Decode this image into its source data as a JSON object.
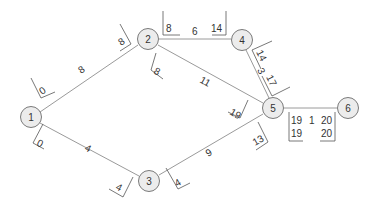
{
  "diagram": {
    "type": "activity-network",
    "nodes": [
      {
        "id": "1",
        "label": "1",
        "x": 31,
        "y": 117
      },
      {
        "id": "2",
        "label": "2",
        "x": 148,
        "y": 39
      },
      {
        "id": "3",
        "label": "3",
        "x": 149,
        "y": 181
      },
      {
        "id": "4",
        "label": "4",
        "x": 242,
        "y": 40
      },
      {
        "id": "5",
        "label": "5",
        "x": 273,
        "y": 108
      },
      {
        "id": "6",
        "label": "6",
        "x": 348,
        "y": 108
      }
    ],
    "edges": [
      {
        "from": "1",
        "to": "2",
        "duration": "8"
      },
      {
        "from": "1",
        "to": "3",
        "duration": "4"
      },
      {
        "from": "2",
        "to": "4",
        "duration": "6"
      },
      {
        "from": "2",
        "to": "5",
        "duration": "11"
      },
      {
        "from": "3",
        "to": "5",
        "duration": "9"
      },
      {
        "from": "4",
        "to": "5",
        "duration": "3"
      },
      {
        "from": "5",
        "to": "6",
        "duration": "1"
      }
    ],
    "times": {
      "e12_start": "0",
      "e12_end": "8",
      "e13_start": "0",
      "e13_end": "4",
      "e24_start": "8",
      "e24_end": "14",
      "e25_start": "8",
      "e25_end": "19",
      "e35_start": "4",
      "e35_end": "13",
      "e45_start": "14",
      "e45_end": "17",
      "e56_es": "19",
      "e56_ef": "20",
      "e56_ls": "19",
      "e56_lf": "20"
    }
  }
}
